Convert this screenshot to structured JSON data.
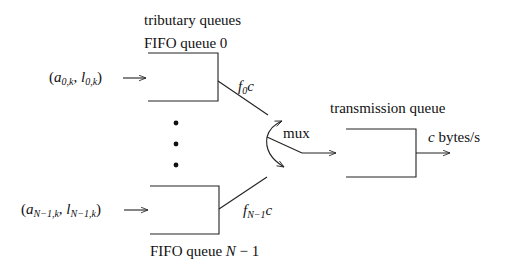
{
  "labels": {
    "tributary_title": "tributary queues",
    "fifo_top": "FIFO queue 0",
    "fifo_bottom_prefix": "FIFO queue ",
    "fifo_bottom_var": "N",
    "fifo_bottom_suffix": " − 1",
    "transmission_title": "transmission queue",
    "mux": "mux",
    "output_var": "c",
    "output_unit": " bytes/s"
  },
  "inputs": {
    "top": {
      "open": "(",
      "a": "a",
      "a_sub": "0,k",
      "sep": ", ",
      "l": "l",
      "l_sub": "0,k",
      "close": ")"
    },
    "bottom": {
      "open": "(",
      "a": "a",
      "a_sub": "N−1,k",
      "sep": ", ",
      "l": "l",
      "l_sub": "N−1,k",
      "close": ")"
    }
  },
  "rates": {
    "top": {
      "f": "f",
      "sub": "0",
      "c": "c"
    },
    "bottom": {
      "f": "f",
      "sub": "N−1",
      "c": "c"
    }
  },
  "colors": {
    "stroke": "#222222",
    "text": "#111111",
    "background": "#ffffff"
  }
}
